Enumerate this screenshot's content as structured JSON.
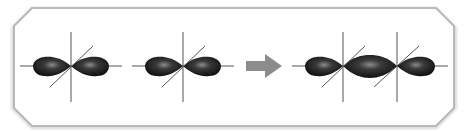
{
  "diagram": {
    "colors": {
      "frame": "#b9b9b9",
      "frame_shadow": "#dcdcdc",
      "lobe_dark": "#0e0e0e",
      "lobe_mid": "#3a3a3a",
      "lobe_highlight": "#8a8a8a",
      "axis": "#555555",
      "arrow": "#8c8c8c"
    },
    "reactants": [
      {
        "name": "p-orbital-1",
        "center_x": 71,
        "center_y": 66
      },
      {
        "name": "p-orbital-2",
        "center_x": 183,
        "center_y": 66
      }
    ],
    "arrow": {
      "label": "",
      "x": 246,
      "y": 66
    },
    "product": {
      "name": "combined-orbital",
      "nodes_x": [
        343,
        397
      ],
      "center_y": 66
    }
  }
}
